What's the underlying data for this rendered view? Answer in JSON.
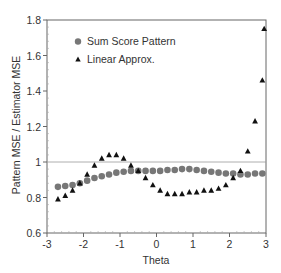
{
  "chart_data": {
    "type": "scatter",
    "title": "",
    "xlabel": "Theta",
    "ylabel": "Pattern MSE / Estimator MSE",
    "xlim": [
      -3,
      3
    ],
    "ylim": [
      0.6,
      1.8
    ],
    "xticks": [
      -3,
      -2,
      -1,
      0,
      1,
      2,
      3
    ],
    "xtick_labels": [
      "-3",
      "-2",
      "-1",
      "0",
      "1",
      "2",
      "3"
    ],
    "yticks": [
      0.6,
      0.8,
      1.0,
      1.2,
      1.4,
      1.6,
      1.8
    ],
    "ytick_labels": [
      "0.6",
      "0.8",
      "1",
      "1.2",
      "1.4",
      "1.6",
      "1.8"
    ],
    "reference_line": {
      "y": 1.0,
      "color": "#999999"
    },
    "grid": false,
    "legend_position": "upper-left-inside",
    "x": [
      -2.7,
      -2.5,
      -2.3,
      -2.1,
      -1.9,
      -1.7,
      -1.5,
      -1.3,
      -1.1,
      -0.9,
      -0.7,
      -0.5,
      -0.3,
      -0.1,
      0.1,
      0.3,
      0.5,
      0.7,
      0.9,
      1.1,
      1.3,
      1.5,
      1.7,
      1.9,
      2.1,
      2.3,
      2.5,
      2.7,
      2.9
    ],
    "series": [
      {
        "name": "Sum Score Pattern",
        "marker": "circle",
        "color": "#777777",
        "values": [
          0.86,
          0.865,
          0.87,
          0.88,
          0.895,
          0.91,
          0.92,
          0.93,
          0.94,
          0.945,
          0.95,
          0.95,
          0.95,
          0.95,
          0.95,
          0.955,
          0.955,
          0.96,
          0.96,
          0.955,
          0.95,
          0.945,
          0.94,
          0.935,
          0.935,
          0.93,
          0.93,
          0.935,
          0.935
        ]
      },
      {
        "name": "Linear Approx.",
        "marker": "triangle",
        "color": "#111111",
        "values": [
          0.79,
          0.81,
          0.84,
          0.88,
          0.93,
          0.98,
          1.02,
          1.04,
          1.04,
          1.02,
          0.98,
          0.95,
          0.91,
          0.87,
          0.84,
          0.82,
          0.82,
          0.82,
          0.83,
          0.83,
          0.84,
          0.84,
          0.85,
          0.87,
          0.91,
          0.95,
          1.06,
          1.23,
          1.46
        ]
      }
    ],
    "extra_points": [
      {
        "series": "Linear Approx.",
        "x": 2.95,
        "y": 1.75
      }
    ]
  },
  "legend": {
    "items": [
      {
        "label": "Sum Score Pattern",
        "marker": "circle"
      },
      {
        "label": "Linear Approx.",
        "marker": "triangle"
      }
    ]
  }
}
